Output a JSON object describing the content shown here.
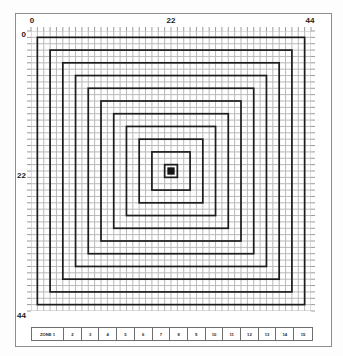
{
  "diagram": {
    "axis": {
      "top_labels": [
        {
          "text": "0",
          "value": 0
        },
        {
          "text": "22",
          "value": 22
        },
        {
          "text": "44",
          "value": 44
        }
      ],
      "left_labels": [
        {
          "text": "0",
          "value": 0
        },
        {
          "text": "22",
          "value": 22
        },
        {
          "text": "44",
          "value": 44
        }
      ],
      "x_min": 0,
      "x_max": 44,
      "y_min": 0,
      "y_max": 44
    },
    "grid": {
      "columns": 44,
      "rows": 44,
      "cell_color": "#b9b9b9",
      "ring_color": "#1c1c1c",
      "center_color": "#141414"
    },
    "rings": [
      {
        "index": 1,
        "half_extent": 21
      },
      {
        "index": 2,
        "half_extent": 19
      },
      {
        "index": 3,
        "half_extent": 17
      },
      {
        "index": 4,
        "half_extent": 15
      },
      {
        "index": 5,
        "half_extent": 13
      },
      {
        "index": 6,
        "half_extent": 11
      },
      {
        "index": 7,
        "half_extent": 9
      },
      {
        "index": 8,
        "half_extent": 7
      },
      {
        "index": 9,
        "half_extent": 5
      },
      {
        "index": 10,
        "half_extent": 3
      },
      {
        "index": 11,
        "half_extent": 1
      }
    ],
    "center_marker": {
      "x": 22,
      "y": 22,
      "size": 1
    },
    "zone_legend": {
      "cells": [
        {
          "label": "ZONE 1"
        },
        {
          "label": "2"
        },
        {
          "label": "3"
        },
        {
          "label": "4"
        },
        {
          "label": "5"
        },
        {
          "label": "6"
        },
        {
          "label": "7"
        },
        {
          "label": "8"
        },
        {
          "label": "9"
        },
        {
          "label": "10"
        },
        {
          "label": "11"
        },
        {
          "label": "12"
        },
        {
          "label": "13"
        },
        {
          "label": "14"
        },
        {
          "label": "15"
        }
      ]
    }
  }
}
